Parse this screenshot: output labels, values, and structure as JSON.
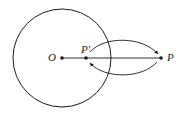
{
  "diagram": {
    "type": "circle-inversion",
    "colors": {
      "stroke": "#1a1a1a",
      "background": "#ffffff"
    },
    "circle": {
      "cx": 62,
      "cy": 58,
      "r": 49
    },
    "points": [
      {
        "id": "O",
        "label": "O",
        "x": 62,
        "y": 58
      },
      {
        "id": "P_prime",
        "label": "P′",
        "x": 86,
        "y": 58
      },
      {
        "id": "P",
        "label": "P",
        "x": 161,
        "y": 58
      }
    ],
    "segment": {
      "from": "O",
      "to": "P"
    },
    "arrows": [
      {
        "from": "P_prime",
        "to": "P",
        "side": "upper"
      },
      {
        "from": "P",
        "to": "P_prime",
        "side": "lower"
      }
    ]
  }
}
